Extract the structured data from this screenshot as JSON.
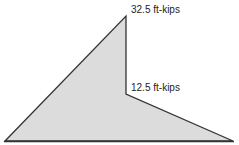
{
  "diagram": {
    "type": "moment-diagram",
    "fill_color": "#dcdcdc",
    "stroke_color": "#333333",
    "labels": {
      "peak": "32.5 ft-kips",
      "step": "12.5 ft-kips"
    },
    "values_ft_kips": [
      32.5,
      12.5
    ]
  }
}
